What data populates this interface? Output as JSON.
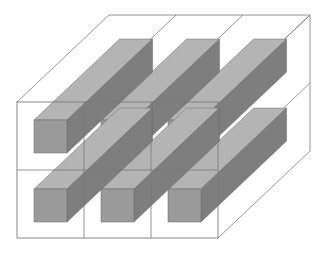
{
  "diagram": {
    "title": "",
    "frame": {
      "front": {
        "x0": 17,
        "y0": 102,
        "x1": 218,
        "y1": 238
      },
      "back_offset": {
        "dx": 92,
        "dy": -87
      },
      "rows": 2,
      "cols": 3,
      "line_color": "#7a7a7a"
    },
    "bars": {
      "front_size": 33,
      "front_color": "#9a9a9a",
      "top_color": "#b4b4b4",
      "side_color": "#7e7e7e",
      "edge_color": "#6a6a6a",
      "length_scale": 0.93,
      "cells": [
        {
          "row": 0,
          "col": 0,
          "x": 34,
          "y": 120
        },
        {
          "row": 0,
          "col": 1,
          "x": 101,
          "y": 120
        },
        {
          "row": 0,
          "col": 2,
          "x": 168,
          "y": 120
        },
        {
          "row": 1,
          "col": 0,
          "x": 34,
          "y": 189
        },
        {
          "row": 1,
          "col": 1,
          "x": 101,
          "y": 189
        },
        {
          "row": 1,
          "col": 2,
          "x": 168,
          "y": 189
        }
      ]
    }
  }
}
